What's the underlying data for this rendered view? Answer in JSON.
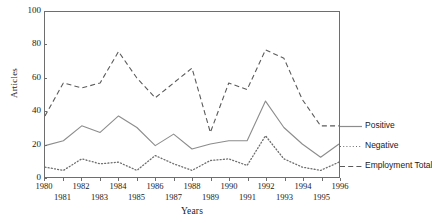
{
  "chart_data": {
    "type": "line",
    "title": "",
    "xlabel": "Years",
    "ylabel": "Articles",
    "xlim": [
      1980,
      1996
    ],
    "ylim": [
      0,
      100
    ],
    "yticks": [
      0,
      20,
      40,
      60,
      80,
      100
    ],
    "grid": false,
    "legend_position": "right",
    "x": [
      1980,
      1981,
      1982,
      1983,
      1984,
      1985,
      1986,
      1987,
      1988,
      1989,
      1990,
      1991,
      1992,
      1993,
      1994,
      1995,
      1996
    ],
    "xtick_labels_top": [
      "1980",
      "1982",
      "1984",
      "1986",
      "1988",
      "1990",
      "1992",
      "1994",
      "1996"
    ],
    "xtick_labels_bottom": [
      "1981",
      "1983",
      "1985",
      "1987",
      "1989",
      "1991",
      "1993",
      "1995"
    ],
    "series": [
      {
        "name": "Positive",
        "style": "solid",
        "color": "#8c8c8c",
        "values": [
          19,
          22,
          31,
          27,
          37,
          30,
          19,
          26,
          17,
          20,
          22,
          22,
          46,
          30,
          20,
          12,
          20
        ]
      },
      {
        "name": "Negative",
        "style": "dotted",
        "color": "#6e6e6e",
        "values": [
          6,
          4,
          11,
          8,
          9,
          4,
          13,
          8,
          4,
          10,
          11,
          7,
          25,
          11,
          6,
          4,
          9
        ]
      },
      {
        "name": "Employment Total",
        "style": "dashed",
        "color": "#5a5a5a",
        "values": [
          37,
          57,
          54,
          57,
          76,
          60,
          48,
          57,
          66,
          27,
          57,
          53,
          77,
          72,
          47,
          31,
          31
        ]
      }
    ]
  },
  "legend": {
    "items": [
      {
        "label": "Positive",
        "style": "solid"
      },
      {
        "label": "Negative",
        "style": "dotted"
      },
      {
        "label": "Employment Total",
        "style": "dashed"
      }
    ]
  },
  "axes": {
    "y_title": "Articles",
    "x_title": "Years"
  }
}
